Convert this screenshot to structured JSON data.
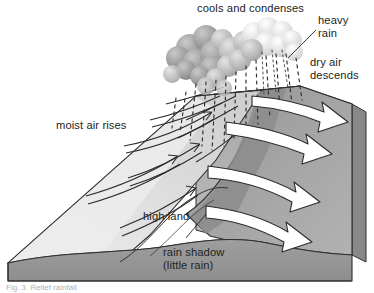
{
  "figure": {
    "type": "block-diagram",
    "background_color": "#ffffff",
    "ink_color": "#232323"
  },
  "labels": {
    "cools_and_condenses": "cools and condenses",
    "heavy_rain": "heavy\nrain",
    "heavy_rain_line1": "heavy",
    "heavy_rain_line2": "rain",
    "dry_air_descends_line1": "dry air",
    "dry_air_descends_line2": "descends",
    "moist_air_rises": "moist air rises",
    "high_land": "high land",
    "rain_shadow_line1": "rain shadow",
    "rain_shadow_line2": "(little rain)"
  },
  "caption": {
    "text": "Fig. 3  Relief rainfall",
    "clipped": true
  },
  "palette": {
    "windward_slope": "#dcdcdc",
    "windward_slope_light": "#e8e8e8",
    "summit_ridge": "#cfcfcf",
    "lee_slope": "#a2a2a2",
    "lee_slope_dark": "#8f8f8f",
    "plain": "#b4b4b4",
    "block_front_face": "#9a9a9a",
    "block_side_face": "#8a8a8a",
    "cloud_dark": "#8d8d8d",
    "cloud_mid": "#b0b0b0",
    "cloud_light": "#e4e4e4",
    "cloud_highlight": "#ffffff",
    "arrow_fill": "#ffffff",
    "arrow_stroke": "#2b2b2b",
    "rain_stroke": "#2e2e2e"
  },
  "elements": {
    "clouds_count": 22,
    "white_arrows_count": 4,
    "thin_arrows_count": 5,
    "rain_streak_columns": 11
  }
}
